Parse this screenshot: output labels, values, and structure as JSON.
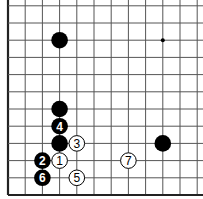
{
  "diagram": {
    "type": "go-board-fragment",
    "corner": "bottom-left",
    "visible_columns": 12,
    "visible_rows": 12,
    "colors": {
      "black": "#000000",
      "white": "#ffffff",
      "line": "#555555",
      "border": "#222222"
    },
    "star_points": [
      {
        "col": 9,
        "row": 9
      }
    ],
    "stones": [
      {
        "color": "black",
        "col": 3,
        "row": 9,
        "label": ""
      },
      {
        "color": "black",
        "col": 3,
        "row": 5,
        "label": ""
      },
      {
        "color": "black",
        "col": 3,
        "row": 4,
        "label": "4"
      },
      {
        "color": "black",
        "col": 3,
        "row": 3,
        "label": ""
      },
      {
        "color": "white",
        "col": 4,
        "row": 3,
        "label": "3"
      },
      {
        "color": "black",
        "col": 9,
        "row": 3,
        "label": ""
      },
      {
        "color": "black",
        "col": 2,
        "row": 2,
        "label": "2"
      },
      {
        "color": "white",
        "col": 3,
        "row": 2,
        "label": "1"
      },
      {
        "color": "white",
        "col": 7,
        "row": 2,
        "label": "7"
      },
      {
        "color": "black",
        "col": 2,
        "row": 1,
        "label": "6"
      },
      {
        "color": "white",
        "col": 4,
        "row": 1,
        "label": "5"
      }
    ]
  }
}
